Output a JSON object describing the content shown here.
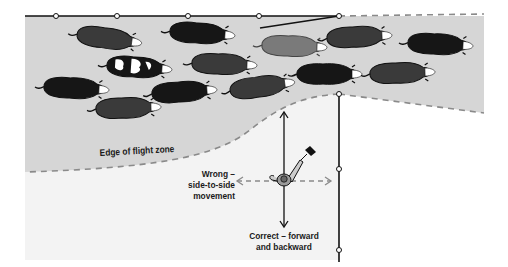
{
  "diagram": {
    "labels": {
      "flight_zone_edge": "Edge of flight zone",
      "wrong_line1": "Wrong –",
      "wrong_line2": "side-to-side",
      "wrong_line3": "movement",
      "correct_line1": "Correct – forward",
      "correct_line2": "and backward"
    },
    "colors": {
      "flight_zone_fill": "#d6d6d6",
      "outside_fill": "#f3f3f3",
      "fence": "#111111",
      "dashed_boundary": "#8a8a8a",
      "cow_black": "#161616",
      "cow_dark_gray": "#3a3a3a",
      "cow_mid_gray": "#7a7a7a",
      "arrow_solid": "#111111",
      "arrow_dashed": "#8a8a8a"
    },
    "elements": {
      "cow_count": 14,
      "fence_posts_top": 5,
      "fence_posts_right": 4,
      "handler": "person-with-flag"
    }
  }
}
